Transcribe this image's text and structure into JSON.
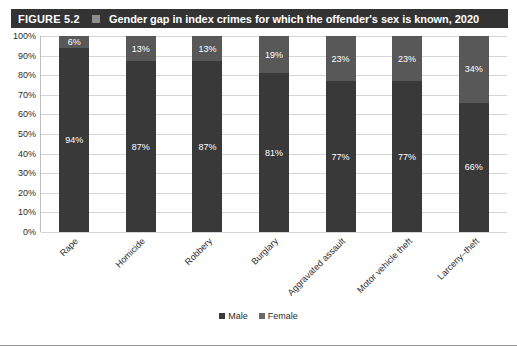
{
  "header": {
    "figure_number": "FIGURE 5.2",
    "separator_icon": "square-marker-icon",
    "title": "Gender gap in index crimes for which the offender's sex is known, 2020",
    "bar_color": "#333333",
    "marker_color": "#8d8d8d"
  },
  "legend": {
    "position": "bottom-center",
    "items": [
      {
        "label": "Male",
        "color": "#393939"
      },
      {
        "label": "Female",
        "color": "#6a6a6a"
      }
    ]
  },
  "axis": {
    "y_ticks": [
      "0%",
      "10%",
      "20%",
      "30%",
      "40%",
      "50%",
      "60%",
      "70%",
      "80%",
      "90%",
      "100%"
    ]
  },
  "chart_data": {
    "type": "bar",
    "stacked": true,
    "title": "Gender gap in index crimes for which the offender's sex is known, 2020",
    "xlabel": "",
    "ylabel": "",
    "ylim": [
      0,
      100
    ],
    "ytick_step": 10,
    "grid": true,
    "legend_position": "bottom-center",
    "categories": [
      "Rape",
      "Homicide",
      "Robbery",
      "Burglary",
      "Aggravated assault",
      "Motor vehicle theft",
      "Larceny–theft"
    ],
    "series": [
      {
        "name": "Male",
        "color": "#393939",
        "values": [
          94,
          87,
          87,
          81,
          77,
          77,
          66
        ]
      },
      {
        "name": "Female",
        "color": "#585858",
        "values": [
          6,
          13,
          13,
          19,
          23,
          23,
          34
        ]
      }
    ],
    "data_labels": {
      "Male": [
        "94%",
        "87%",
        "87%",
        "81%",
        "77%",
        "77%",
        "66%"
      ],
      "Female": [
        "6%",
        "13%",
        "13%",
        "19%",
        "23%",
        "23%",
        "34%"
      ]
    }
  }
}
